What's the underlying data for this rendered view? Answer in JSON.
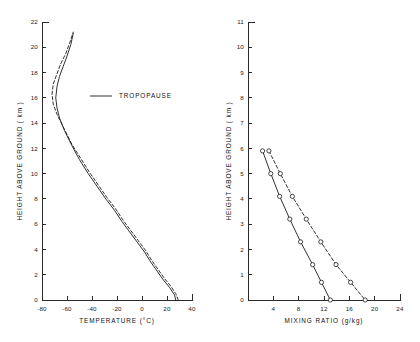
{
  "figure": {
    "background_color": "#ffffff",
    "line_color": "#1a1a1a"
  },
  "chart_data": [
    {
      "type": "line",
      "panel": "left",
      "title": "",
      "xlabel": "TEMPERATURE (°C)",
      "ylabel": "HEIGHT ABOVE GROUND ( km )",
      "xlim": [
        -80,
        40
      ],
      "ylim": [
        0,
        22
      ],
      "xticks": [
        -80,
        -60,
        -40,
        -20,
        0,
        20,
        40
      ],
      "xticklabels": [
        "-80",
        "-60",
        "-40",
        "-20",
        "0",
        "20",
        "40"
      ],
      "yticks": [
        0,
        2,
        4,
        6,
        8,
        10,
        12,
        14,
        16,
        18,
        20,
        22
      ],
      "yticklabels": [
        "0",
        "2",
        "4",
        "6",
        "8",
        "10",
        "12",
        "14",
        "16",
        "18",
        "20",
        "22"
      ],
      "grid": false,
      "legend": [
        {
          "label": "TROPOPAUSE",
          "style": "solid"
        }
      ],
      "legend_position": "upper-center",
      "series": [
        {
          "name": "temperature-solid",
          "style": "solid",
          "x": [
            27,
            26,
            22,
            17,
            12,
            7,
            2,
            -4,
            -10,
            -16,
            -22,
            -29,
            -36,
            -43,
            -50,
            -56,
            -62,
            -66,
            -68,
            -69,
            -68,
            -66,
            -63,
            -60,
            -57,
            -55
          ],
          "y": [
            0.0,
            0.4,
            1.0,
            1.6,
            2.3,
            3.0,
            3.8,
            4.6,
            5.4,
            6.2,
            7.1,
            8.0,
            9.0,
            10.0,
            11.1,
            12.2,
            13.4,
            14.4,
            15.2,
            16.0,
            16.9,
            17.7,
            18.5,
            19.3,
            20.2,
            21.1
          ]
        },
        {
          "name": "temperature-dashed",
          "style": "dashed",
          "x": [
            29,
            27,
            23,
            18,
            13,
            8,
            3,
            -3,
            -9,
            -15,
            -21,
            -28,
            -35,
            -42,
            -49,
            -56,
            -62,
            -68,
            -71,
            -72,
            -71,
            -68,
            -65,
            -61,
            -58,
            -55
          ],
          "y": [
            0.0,
            0.5,
            1.1,
            1.7,
            2.4,
            3.1,
            3.9,
            4.7,
            5.5,
            6.3,
            7.2,
            8.1,
            9.1,
            10.1,
            11.2,
            12.3,
            13.5,
            14.7,
            15.5,
            16.3,
            17.1,
            17.9,
            18.7,
            19.5,
            20.3,
            21.2
          ]
        }
      ]
    },
    {
      "type": "line",
      "panel": "right",
      "title": "",
      "xlabel": "MIXING RATIO (g/kg)",
      "ylabel": "HEIGHT ABOVE GROUND ( km )",
      "xlim": [
        0,
        24
      ],
      "ylim": [
        0,
        11
      ],
      "xticks": [
        4,
        8,
        12,
        16,
        20,
        24
      ],
      "xticklabels": [
        "4",
        "8",
        "12",
        "16",
        "20",
        "24"
      ],
      "yticks": [
        0,
        1,
        2,
        3,
        4,
        5,
        6,
        7,
        8,
        9,
        10,
        11
      ],
      "yticklabels": [
        "0",
        "1",
        "2",
        "3",
        "4",
        "5",
        "6",
        "7",
        "8",
        "9",
        "10",
        "11"
      ],
      "grid": false,
      "markers": "open-circle",
      "series": [
        {
          "name": "mixing-ratio-solid",
          "style": "solid",
          "x": [
            2.3,
            3.6,
            5.0,
            6.6,
            8.3,
            10.2,
            11.6,
            13.0
          ],
          "y": [
            5.9,
            5.0,
            4.1,
            3.2,
            2.3,
            1.4,
            0.7,
            0.0
          ]
        },
        {
          "name": "mixing-ratio-dashed",
          "style": "dashed",
          "x": [
            3.3,
            5.1,
            7.0,
            9.2,
            11.5,
            13.9,
            16.2,
            18.5
          ],
          "y": [
            5.9,
            5.0,
            4.1,
            3.2,
            2.3,
            1.4,
            0.7,
            0.0
          ]
        }
      ]
    }
  ]
}
